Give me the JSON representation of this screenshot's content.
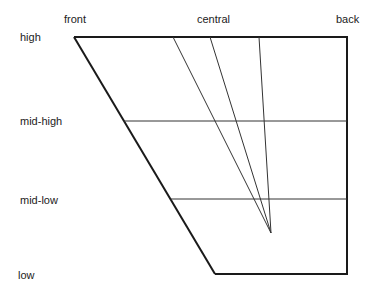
{
  "diagram": {
    "type": "vowel-trapezoid",
    "column_labels": {
      "front": "front",
      "central": "central",
      "back": "back"
    },
    "row_labels": {
      "high": "high",
      "mid_high": "mid-high",
      "mid_low": "mid-low",
      "low": "low"
    },
    "colors": {
      "outline": "#1a1a1a",
      "inner_lines": "#333333",
      "text": "#222222"
    }
  }
}
